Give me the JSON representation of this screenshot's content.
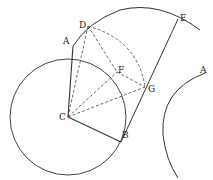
{
  "diagram": {
    "labels": {
      "A": "A",
      "D": "D",
      "E": "E",
      "F": "F",
      "G": "G",
      "C": "C",
      "B": "B",
      "A2": "A"
    },
    "colors": {
      "stroke": "#333333",
      "background": "#ffffff"
    }
  }
}
